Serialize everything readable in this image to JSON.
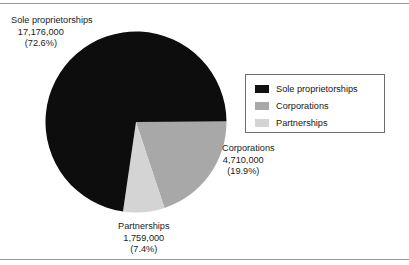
{
  "chart_data": {
    "type": "pie",
    "title": "",
    "categories": [
      "Sole proprietorships",
      "Corporations",
      "Partnerships"
    ],
    "values": [
      17176000,
      4710000,
      1759000
    ],
    "percentages": [
      72.6,
      19.9,
      7.4
    ],
    "colors": [
      "#0d0d0d",
      "#a8a8a8",
      "#d4d4d4"
    ],
    "legend_position": "right",
    "grid": false,
    "start_angle_deg": 0,
    "direction": "clockwise",
    "slices": [
      {
        "name": "Sole proprietorships",
        "value": 17176000,
        "value_text": "17,176,000",
        "percent": 72.6,
        "percent_text": "(72.6%)",
        "color": "#0d0d0d"
      },
      {
        "name": "Corporations",
        "value": 4710000,
        "value_text": "4,710,000",
        "percent": 19.9,
        "percent_text": "(19.9%)",
        "color": "#a8a8a8"
      },
      {
        "name": "Partnerships",
        "value": 1759000,
        "value_text": "1,759,000",
        "percent": 7.4,
        "percent_text": "(7.4%)",
        "color": "#d4d4d4"
      }
    ]
  },
  "callouts": {
    "sole": {
      "name": "Sole proprietorships",
      "value": "17,176,000",
      "percent": "(72.6%)"
    },
    "corporations": {
      "name": "Corporations",
      "value": "4,710,000",
      "percent": "(19.9%)"
    },
    "partnerships": {
      "name": "Partnerships",
      "value": "1,759,000",
      "percent": "(7.4%)"
    }
  },
  "legend": {
    "items": [
      {
        "label": "Sole proprietorships",
        "color": "#111111"
      },
      {
        "label": "Corporations",
        "color": "#a8a8a8"
      },
      {
        "label": "Partnerships",
        "color": "#d4d4d4"
      }
    ]
  }
}
